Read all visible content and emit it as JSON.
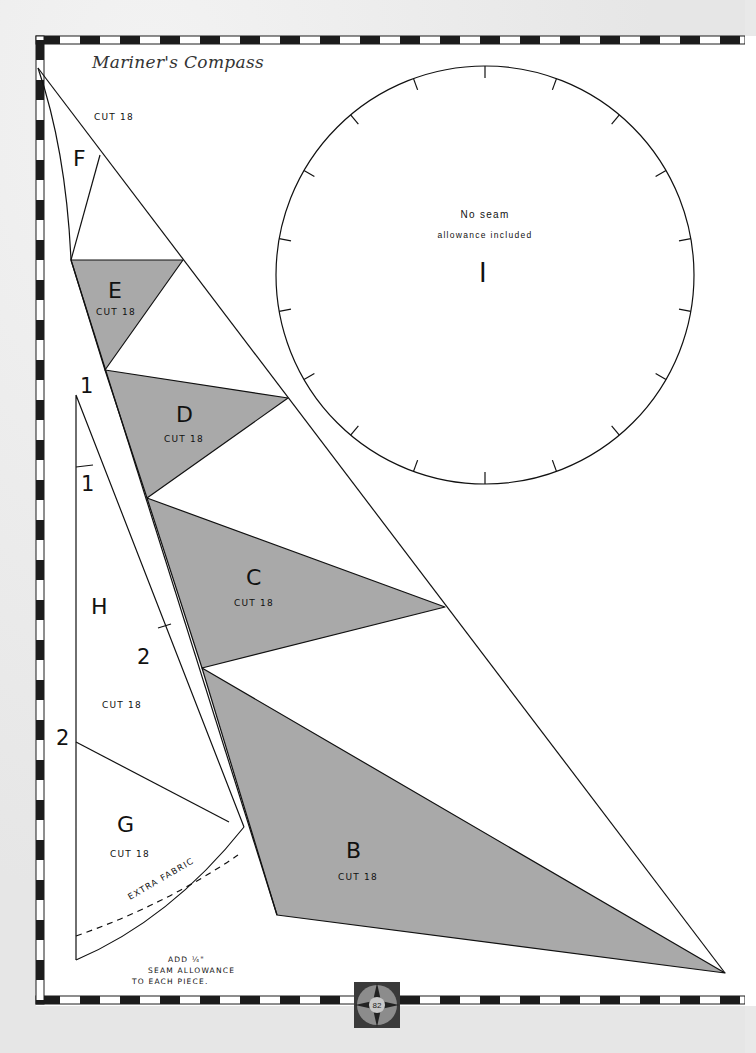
{
  "page": {
    "title": "Mariner's Compass",
    "page_number": "82"
  },
  "colors": {
    "shade": "#a9a9a9",
    "line": "#111111",
    "border_dark": "#1c1c1c"
  },
  "pieces": {
    "F": {
      "letter": "F",
      "cut": "CUT 18"
    },
    "E": {
      "letter": "E",
      "cut": "CUT 18"
    },
    "D": {
      "letter": "D",
      "cut": "CUT 18"
    },
    "C": {
      "letter": "C",
      "cut": "CUT 18"
    },
    "B": {
      "letter": "B",
      "cut": "CUT 18"
    },
    "H": {
      "letter": "H",
      "cut": "CUT 18"
    },
    "G": {
      "letter": "G",
      "cut": "CUT 18"
    },
    "I": {
      "letter": "I",
      "note_line1": "No seam",
      "note_line2": "allowance included"
    }
  },
  "markers": {
    "m1_top": "1",
    "m1_mid": "1",
    "m2_right": "2",
    "m2_left": "2"
  },
  "annotations": {
    "extra_fabric": "EXTRA FABRIC",
    "seam_line1": "ADD ¼\"",
    "seam_line2": "SEAM ALLOWANCE",
    "seam_line3": "TO EACH PIECE."
  }
}
